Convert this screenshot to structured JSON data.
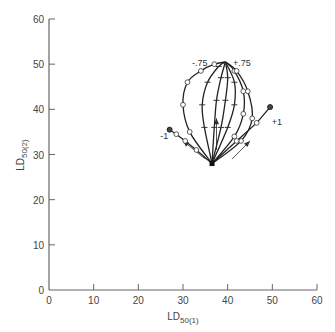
{
  "chart_data": {
    "type": "line",
    "title": "",
    "xlabel": "LD50(1)",
    "ylabel": "LD50(2)",
    "xlabel_main": "LD",
    "xlabel_sub": "50(1)",
    "ylabel_main": "LD",
    "ylabel_sub": "50(2)",
    "xlim": [
      0,
      60
    ],
    "ylim": [
      0,
      60
    ],
    "x_ticks": [
      0,
      10,
      20,
      30,
      40,
      50,
      60
    ],
    "y_ticks": [
      0,
      10,
      20,
      30,
      40,
      50,
      60
    ],
    "grid": false,
    "legend": "none",
    "origin_point": {
      "x": 36.5,
      "y": 28,
      "marker": "filled-square"
    },
    "series": [
      {
        "name": "-1",
        "label": "-1",
        "style": "straight",
        "x": [
          36.5,
          33,
          30.5,
          28.5,
          27
        ],
        "y": [
          28,
          31,
          33,
          34.5,
          35.5
        ],
        "marker": "diamond"
      },
      {
        "name": "-0.75",
        "label": "-.75",
        "style": "curve",
        "x": [
          36.5,
          31.5,
          30,
          31,
          34,
          37,
          39.5
        ],
        "y": [
          28,
          35,
          41,
          46,
          48.5,
          50,
          50.5
        ],
        "marker": "diamond"
      },
      {
        "name": "-0.5",
        "style": "curve",
        "x": [
          36.5,
          34.8,
          34.3,
          35.5,
          38,
          39.5
        ],
        "y": [
          28,
          36,
          41,
          46,
          49.5,
          50.5
        ],
        "marker": "tick"
      },
      {
        "name": "-0.25",
        "style": "curve",
        "x": [
          36.5,
          37,
          37.5,
          38.5,
          39.5
        ],
        "y": [
          28,
          36,
          42,
          47,
          50.5
        ],
        "marker": "tick"
      },
      {
        "name": "0",
        "style": "curve",
        "x": [
          36.5,
          38.5,
          39.5,
          40,
          39.5
        ],
        "y": [
          28,
          36,
          42,
          47,
          50.5
        ],
        "marker": "tick"
      },
      {
        "name": "+0.25",
        "style": "curve",
        "x": [
          36.5,
          40,
          41.5,
          41.5,
          39.5
        ],
        "y": [
          28,
          36,
          41,
          46,
          50.5
        ],
        "marker": "tick"
      },
      {
        "name": "+0.5",
        "style": "curve",
        "x": [
          36.5,
          41.5,
          43.5,
          43.5,
          41.5,
          39.5
        ],
        "y": [
          28,
          34,
          39,
          44,
          48.5,
          50.5
        ],
        "marker": "diamond"
      },
      {
        "name": "+0.75",
        "label": "+.75",
        "style": "curve",
        "x": [
          36.5,
          43,
          45.5,
          44.5,
          42,
          39.5
        ],
        "y": [
          28,
          33,
          38,
          44,
          48.5,
          50.5
        ],
        "marker": "diamond"
      },
      {
        "name": "+1",
        "label": "+1",
        "style": "straight",
        "x": [
          36.5,
          42,
          46.5,
          49.5
        ],
        "y": [
          28,
          33,
          37,
          40.5
        ],
        "marker": "diamond"
      }
    ],
    "arrows": [
      {
        "from": {
          "x": 35,
          "y": 29
        },
        "to": {
          "x": 30,
          "y": 33
        }
      },
      {
        "from": {
          "x": 37.5,
          "y": 31
        },
        "to": {
          "x": 37.5,
          "y": 38
        }
      },
      {
        "from": {
          "x": 41,
          "y": 29
        },
        "to": {
          "x": 45,
          "y": 33
        }
      }
    ]
  }
}
